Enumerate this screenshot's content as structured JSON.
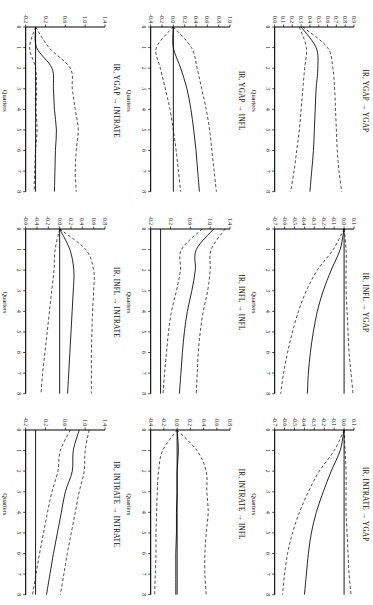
{
  "figure": {
    "xlabel": "Quarters",
    "arrow": "→",
    "xticks": [
      "0",
      "1",
      "2",
      "3",
      "4",
      "5",
      "6",
      "7",
      "8"
    ],
    "xlim": [
      0,
      8
    ],
    "series_names": [
      "mean",
      "lower_band",
      "upper_band"
    ]
  },
  "chart_data": {
    "type": "line",
    "xlabel": "Quarters",
    "ylabel": "",
    "grid": false,
    "legend": "none",
    "panels": [
      {
        "id": "ygap-to-ygap",
        "title": "IR, YGAP → YGAP",
        "row": 1,
        "col": 1,
        "x": [
          0,
          1,
          2,
          3,
          4,
          5,
          6,
          7,
          8
        ],
        "ylim": [
          0.0,
          0.9
        ],
        "yticks": [
          "0.9",
          "0.8",
          "0.7",
          "0.6",
          "0.5",
          "0.4",
          "0.3",
          "0.2",
          "0.1",
          "0.0"
        ],
        "ytickvals": [
          0.9,
          0.8,
          0.7,
          0.6,
          0.5,
          0.4,
          0.3,
          0.2,
          0.1,
          0.0
        ],
        "series": [
          {
            "name": "mean",
            "style": "solid",
            "values": [
              0.3,
              0.47,
              0.49,
              0.47,
              0.46,
              0.45,
              0.44,
              0.42,
              0.4
            ]
          },
          {
            "name": "upper_band",
            "style": "dashed",
            "values": [
              0.32,
              0.6,
              0.66,
              0.68,
              0.69,
              0.7,
              0.71,
              0.73,
              0.76
            ]
          },
          {
            "name": "lower_band",
            "style": "dashed",
            "values": [
              0.28,
              0.36,
              0.34,
              0.32,
              0.3,
              0.28,
              0.25,
              0.22,
              0.18
            ]
          }
        ]
      },
      {
        "id": "ygap-to-infl",
        "title": "IR, YGAP → INFL",
        "row": 2,
        "col": 1,
        "x": [
          0,
          1,
          2,
          3,
          4,
          5,
          6,
          7,
          8
        ],
        "ylim": [
          -0.4,
          1.0
        ],
        "yticks": [
          "1.0",
          "0.8",
          "0.6",
          "0.4",
          "0.2",
          "0.0",
          "-0.2",
          "-0.4"
        ],
        "ytickvals": [
          1.0,
          0.8,
          0.6,
          0.4,
          0.2,
          0.0,
          -0.2,
          -0.4
        ],
        "series": [
          {
            "name": "mean",
            "style": "solid",
            "values": [
              0.0,
              0.0,
              0.13,
              0.24,
              0.31,
              0.36,
              0.4,
              0.43,
              0.46
            ]
          },
          {
            "name": "upper_band",
            "style": "dashed",
            "values": [
              0.0,
              0.32,
              0.42,
              0.5,
              0.58,
              0.64,
              0.68,
              0.72,
              0.76
            ]
          },
          {
            "name": "lower_band",
            "style": "dashed",
            "values": [
              0.0,
              -0.3,
              -0.23,
              -0.14,
              -0.06,
              0.0,
              0.05,
              0.09,
              0.13
            ]
          }
        ]
      },
      {
        "id": "ygap-to-intrate",
        "title": "IR, YGAP → INTRATE",
        "row": 3,
        "col": 1,
        "x": [
          0,
          1,
          2,
          3,
          4,
          5,
          6,
          7,
          8
        ],
        "ylim": [
          -0.2,
          1.4
        ],
        "yticks": [
          "1.4",
          "1.0",
          "0.6",
          "0.2",
          "-0.2"
        ],
        "ytickvals": [
          1.4,
          1.0,
          0.6,
          0.2,
          -0.2
        ],
        "series": [
          {
            "name": "mean",
            "style": "solid",
            "values": [
              0.0,
              0.02,
              0.33,
              0.36,
              0.38,
              0.42,
              0.4,
              0.39,
              0.38
            ]
          },
          {
            "name": "upper_band",
            "style": "dashed",
            "values": [
              0.0,
              0.27,
              0.7,
              0.74,
              0.8,
              0.86,
              0.82,
              0.8,
              0.82
            ]
          },
          {
            "name": "lower_band",
            "style": "dashed",
            "values": [
              0.0,
              -0.12,
              0.0,
              0.02,
              0.01,
              0.03,
              0.0,
              -0.02,
              -0.03
            ]
          }
        ]
      },
      {
        "id": "infl-to-ygap",
        "title": "IR, INFL → YGAP",
        "row": 1,
        "col": 2,
        "x": [
          0,
          1,
          2,
          3,
          4,
          5,
          6,
          7,
          8
        ],
        "ylim": [
          -0.7,
          0.1
        ],
        "yticks": [
          "0.1",
          "0.0",
          "-0.1",
          "-0.2",
          "-0.3",
          "-0.4",
          "-0.5",
          "-0.6",
          "-0.7"
        ],
        "ytickvals": [
          0.1,
          0.0,
          -0.1,
          -0.2,
          -0.3,
          -0.4,
          -0.5,
          -0.6,
          -0.7
        ],
        "series": [
          {
            "name": "mean",
            "style": "solid",
            "values": [
              0.0,
              -0.04,
              -0.13,
              -0.21,
              -0.27,
              -0.31,
              -0.34,
              -0.36,
              -0.37
            ]
          },
          {
            "name": "upper_band",
            "style": "dashed",
            "values": [
              0.0,
              0.02,
              0.02,
              0.02,
              0.03,
              0.04,
              0.05,
              0.07,
              0.09
            ]
          },
          {
            "name": "lower_band",
            "style": "dashed",
            "values": [
              0.0,
              -0.11,
              -0.27,
              -0.38,
              -0.46,
              -0.52,
              -0.57,
              -0.61,
              -0.64
            ]
          }
        ]
      },
      {
        "id": "infl-to-infl",
        "title": "IR, INFL → INFL",
        "row": 2,
        "col": 2,
        "x": [
          0,
          1,
          2,
          3,
          4,
          5,
          6,
          7,
          8
        ],
        "ylim": [
          -0.2,
          1.4
        ],
        "yticks": [
          "1.4",
          "1.0",
          "0.6",
          "0.2",
          "-0.2"
        ],
        "ytickvals": [
          1.4,
          1.0,
          0.6,
          0.2,
          -0.2
        ],
        "series": [
          {
            "name": "mean",
            "style": "solid",
            "values": [
              1.07,
              0.72,
              0.7,
              0.63,
              0.54,
              0.48,
              0.44,
              0.41,
              0.38
            ]
          },
          {
            "name": "upper_band",
            "style": "dashed",
            "values": [
              1.3,
              1.02,
              1.0,
              0.95,
              0.86,
              0.8,
              0.76,
              0.74,
              0.72
            ]
          },
          {
            "name": "lower_band",
            "style": "dashed",
            "values": [
              0.84,
              0.42,
              0.4,
              0.32,
              0.22,
              0.16,
              0.12,
              0.08,
              0.05
            ]
          }
        ]
      },
      {
        "id": "infl-to-intrate",
        "title": "IR, INFL → INTRATE",
        "row": 3,
        "col": 2,
        "x": [
          0,
          1,
          2,
          3,
          4,
          5,
          6,
          7,
          8
        ],
        "ylim": [
          -0.6,
          0.8
        ],
        "yticks": [
          "0.8",
          "0.6",
          "0.4",
          "0.2",
          "0.0",
          "-0.2",
          "-0.4",
          "-0.6"
        ],
        "ytickvals": [
          0.8,
          0.6,
          0.4,
          0.2,
          0.0,
          -0.2,
          -0.4,
          -0.6
        ],
        "series": [
          {
            "name": "mean",
            "style": "solid",
            "values": [
              0.0,
              0.18,
              0.25,
              0.24,
              0.22,
              0.2,
              0.18,
              0.16,
              0.14
            ]
          },
          {
            "name": "upper_band",
            "style": "dashed",
            "values": [
              0.0,
              0.46,
              0.6,
              0.6,
              0.58,
              0.57,
              0.56,
              0.56,
              0.56
            ]
          },
          {
            "name": "lower_band",
            "style": "dashed",
            "values": [
              0.0,
              -0.08,
              -0.1,
              -0.14,
              -0.18,
              -0.22,
              -0.26,
              -0.3,
              -0.33
            ]
          }
        ]
      },
      {
        "id": "intrate-to-ygap",
        "title": "IR, INTRATE → YGAP",
        "row": 1,
        "col": 3,
        "x": [
          0,
          1,
          2,
          3,
          4,
          5,
          6,
          7,
          8
        ],
        "ylim": [
          -0.7,
          0.1
        ],
        "yticks": [
          "0.1",
          "0.0",
          "-0.1",
          "-0.2",
          "-0.3",
          "-0.4",
          "-0.5",
          "-0.6",
          "-0.7"
        ],
        "ytickvals": [
          0.1,
          0.0,
          -0.1,
          -0.2,
          -0.3,
          -0.4,
          -0.5,
          -0.6,
          -0.7
        ],
        "series": [
          {
            "name": "mean",
            "style": "solid",
            "values": [
              0.0,
              -0.04,
              -0.13,
              -0.21,
              -0.28,
              -0.33,
              -0.36,
              -0.38,
              -0.4
            ]
          },
          {
            "name": "upper_band",
            "style": "dashed",
            "values": [
              0.0,
              0.01,
              0.02,
              0.02,
              0.02,
              0.03,
              0.04,
              0.05,
              0.07
            ]
          },
          {
            "name": "lower_band",
            "style": "dashed",
            "values": [
              0.0,
              -0.1,
              -0.25,
              -0.36,
              -0.45,
              -0.52,
              -0.57,
              -0.6,
              -0.62
            ]
          }
        ]
      },
      {
        "id": "intrate-to-infl",
        "title": "IR, INTRATE → INFL",
        "row": 2,
        "col": 3,
        "x": [
          0,
          1,
          2,
          3,
          4,
          5,
          6,
          7,
          8
        ],
        "ylim": [
          -0.4,
          0.8
        ],
        "yticks": [
          "0.8",
          "0.6",
          "0.4",
          "0.2",
          "0.0",
          "-0.2",
          "-0.4"
        ],
        "ytickvals": [
          0.8,
          0.6,
          0.4,
          0.2,
          0.0,
          -0.2,
          -0.4
        ],
        "series": [
          {
            "name": "mean",
            "style": "solid",
            "values": [
              0.0,
              0.02,
              0.0,
              0.0,
              -0.01,
              -0.01,
              -0.02,
              -0.02,
              -0.02
            ]
          },
          {
            "name": "upper_band",
            "style": "dashed",
            "values": [
              0.0,
              0.3,
              0.44,
              0.45,
              0.47,
              0.44,
              0.42,
              0.42,
              0.44
            ]
          },
          {
            "name": "lower_band",
            "style": "dashed",
            "values": [
              0.0,
              -0.22,
              -0.28,
              -0.3,
              -0.31,
              -0.32,
              -0.32,
              -0.33,
              -0.34
            ]
          }
        ]
      },
      {
        "id": "intrate-to-intrate",
        "title": "IR, INTRATE → INTRATE",
        "row": 3,
        "col": 3,
        "x": [
          0,
          1,
          2,
          3,
          4,
          5,
          6,
          7,
          8
        ],
        "ylim": [
          -0.2,
          1.4
        ],
        "yticks": [
          "1.4",
          "1.0",
          "0.6",
          "0.2",
          "-0.2"
        ],
        "ytickvals": [
          1.4,
          1.0,
          0.6,
          0.2,
          -0.2
        ],
        "series": [
          {
            "name": "mean",
            "style": "solid",
            "values": [
              0.88,
              0.76,
              0.74,
              0.6,
              0.52,
              0.44,
              0.36,
              0.29,
              0.22
            ]
          },
          {
            "name": "upper_band",
            "style": "dashed",
            "values": [
              1.08,
              1.0,
              0.98,
              0.88,
              0.8,
              0.72,
              0.64,
              0.57,
              0.5
            ]
          },
          {
            "name": "lower_band",
            "style": "dashed",
            "values": [
              0.7,
              0.5,
              0.45,
              0.33,
              0.24,
              0.16,
              0.08,
              0.01,
              -0.06
            ]
          }
        ]
      }
    ]
  }
}
